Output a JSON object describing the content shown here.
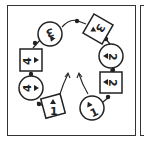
{
  "diagram": {
    "type": "cycle-puzzle",
    "colors": {
      "stroke": "#222222",
      "background": "#ffffff",
      "border": "#333333"
    },
    "nodes": [
      {
        "id": "n1",
        "shape": "circle",
        "number": "3",
        "arrow": "down",
        "cx": 50,
        "cy": 34
      },
      {
        "id": "n2",
        "shape": "diamond",
        "number": "3",
        "arrow": "left-down",
        "cx": 98,
        "cy": 29
      },
      {
        "id": "n3",
        "shape": "circle",
        "number": "2",
        "arrow": "left",
        "cx": 111,
        "cy": 56
      },
      {
        "id": "n4",
        "shape": "square",
        "number": "2",
        "arrow": "left",
        "cx": 111,
        "cy": 82
      },
      {
        "id": "n5",
        "shape": "circle",
        "number": "1",
        "arrow": "up",
        "cx": 92,
        "cy": 108
      },
      {
        "id": "n6",
        "shape": "diamond",
        "number": "1",
        "arrow": "up",
        "cx": 53,
        "cy": 106
      },
      {
        "id": "n7",
        "shape": "circle",
        "number": "4",
        "arrow": "right",
        "cx": 31,
        "cy": 88
      },
      {
        "id": "n8",
        "shape": "square",
        "number": "4",
        "arrow": "right",
        "cx": 31,
        "cy": 60
      }
    ],
    "center_arrows": [
      {
        "id": "arrow-left",
        "direction": "up"
      },
      {
        "id": "arrow-right",
        "direction": "up"
      }
    ]
  }
}
